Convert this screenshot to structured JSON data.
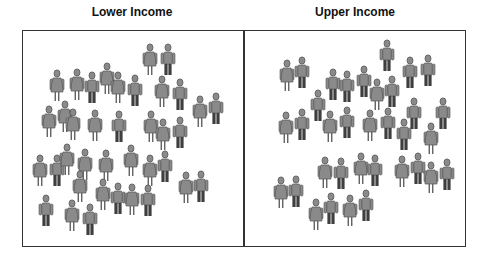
{
  "panels": [
    {
      "title": "Lower Income",
      "title_center_x": 132,
      "people": [
        [
          150,
          44,
          "d"
        ],
        [
          168,
          44,
          "p"
        ],
        [
          57,
          70,
          "d"
        ],
        [
          77,
          69,
          "d"
        ],
        [
          92,
          72,
          "p"
        ],
        [
          107,
          63,
          "d"
        ],
        [
          118,
          72,
          "d"
        ],
        [
          135,
          75,
          "p"
        ],
        [
          162,
          76,
          "d"
        ],
        [
          180,
          79,
          "p"
        ],
        [
          200,
          96,
          "d"
        ],
        [
          216,
          93,
          "p"
        ],
        [
          49,
          106,
          "d"
        ],
        [
          65,
          101,
          "d"
        ],
        [
          73,
          109,
          "d"
        ],
        [
          95,
          110,
          "d"
        ],
        [
          119,
          111,
          "p"
        ],
        [
          151,
          111,
          "d"
        ],
        [
          163,
          119,
          "d"
        ],
        [
          180,
          117,
          "p"
        ],
        [
          40,
          155,
          "d"
        ],
        [
          57,
          155,
          "p"
        ],
        [
          67,
          144,
          "d"
        ],
        [
          85,
          149,
          "d"
        ],
        [
          106,
          150,
          "d"
        ],
        [
          131,
          145,
          "d"
        ],
        [
          150,
          155,
          "d"
        ],
        [
          165,
          151,
          "p"
        ],
        [
          80,
          171,
          "d"
        ],
        [
          103,
          179,
          "d"
        ],
        [
          118,
          183,
          "p"
        ],
        [
          132,
          184,
          "d"
        ],
        [
          148,
          185,
          "p"
        ],
        [
          186,
          172,
          "d"
        ],
        [
          201,
          171,
          "p"
        ],
        [
          46,
          195,
          "p"
        ],
        [
          72,
          200,
          "d"
        ],
        [
          90,
          204,
          "p"
        ]
      ]
    },
    {
      "title": "Upper Income",
      "title_center_x": 355,
      "people": [
        [
          387,
          40,
          "p"
        ],
        [
          287,
          60,
          "d"
        ],
        [
          302,
          57,
          "p"
        ],
        [
          333,
          69,
          "p"
        ],
        [
          347,
          71,
          "p"
        ],
        [
          364,
          66,
          "p"
        ],
        [
          377,
          79,
          "d"
        ],
        [
          392,
          76,
          "p"
        ],
        [
          410,
          57,
          "p"
        ],
        [
          428,
          55,
          "p"
        ],
        [
          318,
          90,
          "p"
        ],
        [
          414,
          98,
          "p"
        ],
        [
          443,
          98,
          "p"
        ],
        [
          286,
          112,
          "d"
        ],
        [
          302,
          109,
          "p"
        ],
        [
          330,
          111,
          "d"
        ],
        [
          347,
          107,
          "p"
        ],
        [
          370,
          110,
          "d"
        ],
        [
          388,
          108,
          "p"
        ],
        [
          404,
          119,
          "p"
        ],
        [
          431,
          123,
          "d"
        ],
        [
          325,
          157,
          "d"
        ],
        [
          341,
          158,
          "p"
        ],
        [
          361,
          153,
          "d"
        ],
        [
          375,
          155,
          "p"
        ],
        [
          402,
          156,
          "d"
        ],
        [
          418,
          153,
          "p"
        ],
        [
          431,
          162,
          "d"
        ],
        [
          447,
          159,
          "p"
        ],
        [
          281,
          177,
          "d"
        ],
        [
          296,
          176,
          "p"
        ],
        [
          316,
          199,
          "d"
        ],
        [
          331,
          193,
          "p"
        ],
        [
          350,
          195,
          "d"
        ],
        [
          366,
          190,
          "p"
        ]
      ]
    }
  ],
  "colors": {
    "body": "#8a8a8a",
    "outline": "#555555",
    "pants": "#3f3f3f",
    "frame": "#333333"
  },
  "legend": {
    "d": "dress-figure",
    "p": "pants-figure"
  }
}
